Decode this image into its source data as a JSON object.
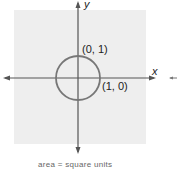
{
  "diagram": {
    "type": "unit-circle-on-axes",
    "axes": {
      "x_label": "x",
      "y_label": "y"
    },
    "points": [
      {
        "label": "(0, 1)",
        "x": 0,
        "y": 1
      },
      {
        "label": "(1, 0)",
        "x": 1,
        "y": 0
      }
    ],
    "circle": {
      "center": "(0, 0)",
      "radius": 1,
      "color": "#777777"
    },
    "background_color": "#eeeeee",
    "caption": "area = square units"
  }
}
